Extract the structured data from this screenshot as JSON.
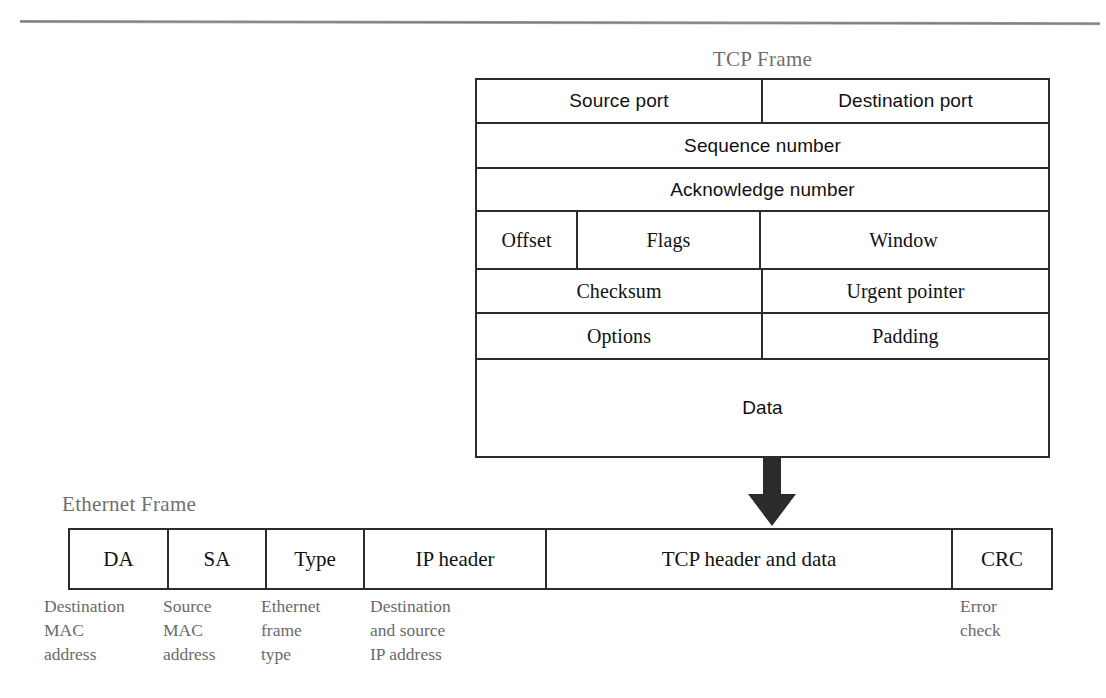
{
  "figure": {
    "kind": "protocol-encapsulation-diagram",
    "top_rule": true
  },
  "tcp_frame": {
    "title": "TCP Frame",
    "rows": [
      {
        "cells": [
          {
            "label": "Source port",
            "style": "sans"
          },
          {
            "label": "Destination port",
            "style": "sans"
          }
        ]
      },
      {
        "cells": [
          {
            "label": "Sequence number",
            "style": "sans"
          }
        ]
      },
      {
        "cells": [
          {
            "label": "Acknowledge number",
            "style": "sans"
          }
        ]
      },
      {
        "cells": [
          {
            "label": "Offset",
            "style": "serif"
          },
          {
            "label": "Flags",
            "style": "serif"
          },
          {
            "label": "Window",
            "style": "serif"
          }
        ]
      },
      {
        "cells": [
          {
            "label": "Checksum",
            "style": "serif"
          },
          {
            "label": "Urgent pointer",
            "style": "serif"
          }
        ]
      },
      {
        "cells": [
          {
            "label": "Options",
            "style": "serif"
          },
          {
            "label": "Padding",
            "style": "serif"
          }
        ]
      },
      {
        "cells": [
          {
            "label": "Data",
            "style": "sans"
          }
        ]
      }
    ]
  },
  "arrow": {
    "direction": "down",
    "color": "#2b2b2b",
    "meaning": "encapsulation"
  },
  "ethernet_frame": {
    "title": "Ethernet Frame",
    "cells": [
      {
        "label": "DA",
        "caption": "Destination\nMAC\naddress"
      },
      {
        "label": "SA",
        "caption": "Source\nMAC\naddress"
      },
      {
        "label": "Type",
        "caption": "Ethernet\nframe\ntype"
      },
      {
        "label": "IP header",
        "caption": "Destination\nand source\nIP address"
      },
      {
        "label": "TCP header and data",
        "caption": ""
      },
      {
        "label": "CRC",
        "caption": "Error\ncheck"
      }
    ]
  },
  "colors": {
    "ink": "#111111",
    "rule": "#2b2b2b",
    "caption": "#6a6a6a",
    "title": "#6f6f6f",
    "background": "#ffffff"
  }
}
